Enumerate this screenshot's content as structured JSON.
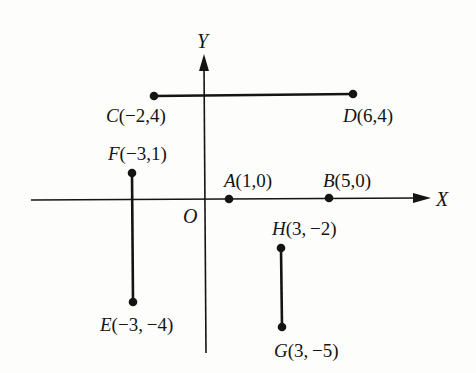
{
  "diagram": {
    "title": "",
    "axes": {
      "x_label": "X",
      "y_label": "Y",
      "origin_label": "O"
    },
    "colors": {
      "ink": "#141414",
      "background": "#fdfdfc"
    },
    "points": [
      {
        "name": "A",
        "coords": "(1,0)",
        "x": 1,
        "y": 0
      },
      {
        "name": "B",
        "coords": "(5,0)",
        "x": 5,
        "y": 0
      },
      {
        "name": "C",
        "coords": "(−2,4)",
        "x": -2,
        "y": 4
      },
      {
        "name": "D",
        "coords": "(6,4)",
        "x": 6,
        "y": 4
      },
      {
        "name": "E",
        "coords": "(−3, −4)",
        "x": -3,
        "y": -4
      },
      {
        "name": "F",
        "coords": "(−3,1)",
        "x": -3,
        "y": 1
      },
      {
        "name": "G",
        "coords": "(3, −5)",
        "x": 3,
        "y": -5
      },
      {
        "name": "H",
        "coords": "(3, −2)",
        "x": 3,
        "y": -2
      }
    ],
    "segments": [
      {
        "from": "C",
        "to": "D"
      },
      {
        "from": "F",
        "to": "E"
      },
      {
        "from": "H",
        "to": "G"
      }
    ]
  }
}
